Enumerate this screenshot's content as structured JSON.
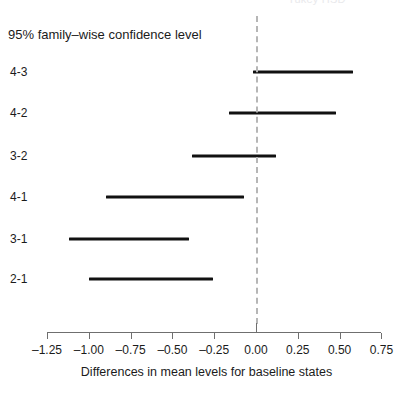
{
  "figure": {
    "clipped_top_title": "Tukey HSD",
    "confidence_label": "95% family–wise confidence level",
    "xlabel": "Differences in mean levels for baseline states"
  },
  "chart_data": {
    "type": "bar",
    "subtype": "confidence-interval-dot-plot",
    "title": "",
    "xlabel": "Differences in mean levels for baseline states",
    "ylabel": "",
    "xlim": [
      -1.35,
      0.8
    ],
    "xticks": [
      -1.25,
      -1.0,
      -0.75,
      -0.5,
      -0.25,
      0.0,
      0.25,
      0.5,
      0.75
    ],
    "xticklabels": [
      "-1.25",
      "-1.00",
      "-0.75",
      "-0.50",
      "-0.25",
      "0.00",
      "0.25",
      "0.50",
      "0.75"
    ],
    "grid": false,
    "legend": null,
    "reference_line": {
      "x": 0.0,
      "style": "dashed",
      "color": "#b6b6b6"
    },
    "categories": [
      "4-3",
      "4-2",
      "3-2",
      "4-1",
      "3-1",
      "2-1"
    ],
    "series": [
      {
        "name": "lower",
        "values": [
          -0.02,
          -0.16,
          -0.38,
          -0.9,
          -1.12,
          -1.0
        ]
      },
      {
        "name": "upper",
        "values": [
          0.58,
          0.48,
          0.12,
          -0.07,
          -0.4,
          -0.26
        ]
      }
    ],
    "intervals": [
      {
        "label": "4-3",
        "lower": -0.02,
        "upper": 0.58
      },
      {
        "label": "4-2",
        "lower": -0.16,
        "upper": 0.48
      },
      {
        "label": "3-2",
        "lower": -0.38,
        "upper": 0.12
      },
      {
        "label": "4-1",
        "lower": -0.9,
        "upper": -0.07
      },
      {
        "label": "3-1",
        "lower": -1.12,
        "upper": -0.4
      },
      {
        "label": "2-1",
        "lower": -1.0,
        "upper": -0.26
      }
    ]
  },
  "axis_ticks": [
    {
      "value": -1.25,
      "label": "-1.25"
    },
    {
      "value": -1.0,
      "label": "-1.00"
    },
    {
      "value": -0.75,
      "label": "-0.75"
    },
    {
      "value": -0.5,
      "label": "-0.50"
    },
    {
      "value": -0.25,
      "label": "-0.25"
    },
    {
      "value": 0.0,
      "label": "0.00"
    },
    {
      "value": 0.25,
      "label": "0.25"
    },
    {
      "value": 0.5,
      "label": "0.50"
    },
    {
      "value": 0.75,
      "label": "0.75"
    }
  ],
  "colors": {
    "interval": "#111111",
    "axis": "#6f6f6f",
    "reference": "#b6b6b6",
    "text": "#1b1b1b",
    "background": "#ffffff"
  }
}
